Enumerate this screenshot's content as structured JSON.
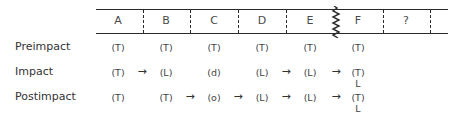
{
  "diagram": {
    "columns": [
      "A",
      "B",
      "C",
      "D",
      "E",
      "F",
      "?"
    ],
    "break_marker": "zigzag-between-E-and-F",
    "rows": [
      {
        "label": "Preimpact",
        "cells": [
          "(T)",
          "(T)",
          "(T)",
          "(T)",
          "(T)",
          "(T)",
          ""
        ],
        "arrows_after": []
      },
      {
        "label": "Impact",
        "cells": [
          "(T)",
          "(L)",
          "(d)",
          "(L)",
          "(L)",
          "(T)",
          ""
        ],
        "sub": [
          "",
          "",
          "",
          "",
          "",
          "L",
          ""
        ],
        "arrows_after": [
          "A",
          "D",
          "E"
        ]
      },
      {
        "label": "Postimpact",
        "cells": [
          "(T)",
          "(T)",
          "(o)",
          "(L)",
          "(L)",
          "(T)",
          ""
        ],
        "sub": [
          "",
          "",
          "",
          "",
          "",
          "L",
          ""
        ],
        "arrows_after": [
          "B",
          "C",
          "D",
          "E"
        ]
      }
    ],
    "arrow_glyph": "→",
    "colors": {
      "line": "#2a2a2a",
      "text": "#444444"
    }
  }
}
